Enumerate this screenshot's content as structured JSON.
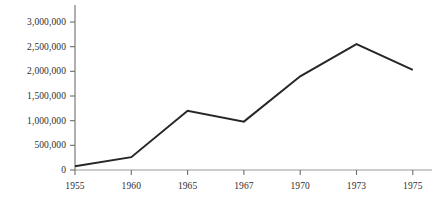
{
  "chart_data": {
    "type": "line",
    "title": "",
    "subtitle": "",
    "xlabel": "",
    "ylabel": "",
    "categories": [
      "1955",
      "1960",
      "1965",
      "1967",
      "1970",
      "1973",
      "1975"
    ],
    "values": [
      75000,
      260000,
      1200000,
      980000,
      1900000,
      2550000,
      2030000
    ],
    "series": [
      {
        "name": "",
        "values": [
          75000,
          260000,
          1200000,
          980000,
          1900000,
          2550000,
          2030000
        ]
      }
    ],
    "ylim": [
      0,
      3000000
    ],
    "ytick_values": [
      0,
      500000,
      1000000,
      1500000,
      2000000,
      2500000,
      3000000
    ],
    "ytick_labels": [
      "0",
      "500,000",
      "1,000,000",
      "1,500,000",
      "2,000,000",
      "2,500,000",
      "3,000,000"
    ],
    "xtick_labels": [
      "1955",
      "1960",
      "1965",
      "1967",
      "1970",
      "1973",
      "1975"
    ],
    "grid": false,
    "legend": false,
    "legend_position": "none",
    "line_color": "#262626",
    "axis_color": "#6e6e6e",
    "background_color": "#ffffff",
    "text_color": "#2e2e2e",
    "annotations": []
  },
  "layout": {
    "plot_left": 75,
    "plot_right": 432,
    "plot_top": 5,
    "plot_baseline": 170,
    "x_step": 56.3
  }
}
